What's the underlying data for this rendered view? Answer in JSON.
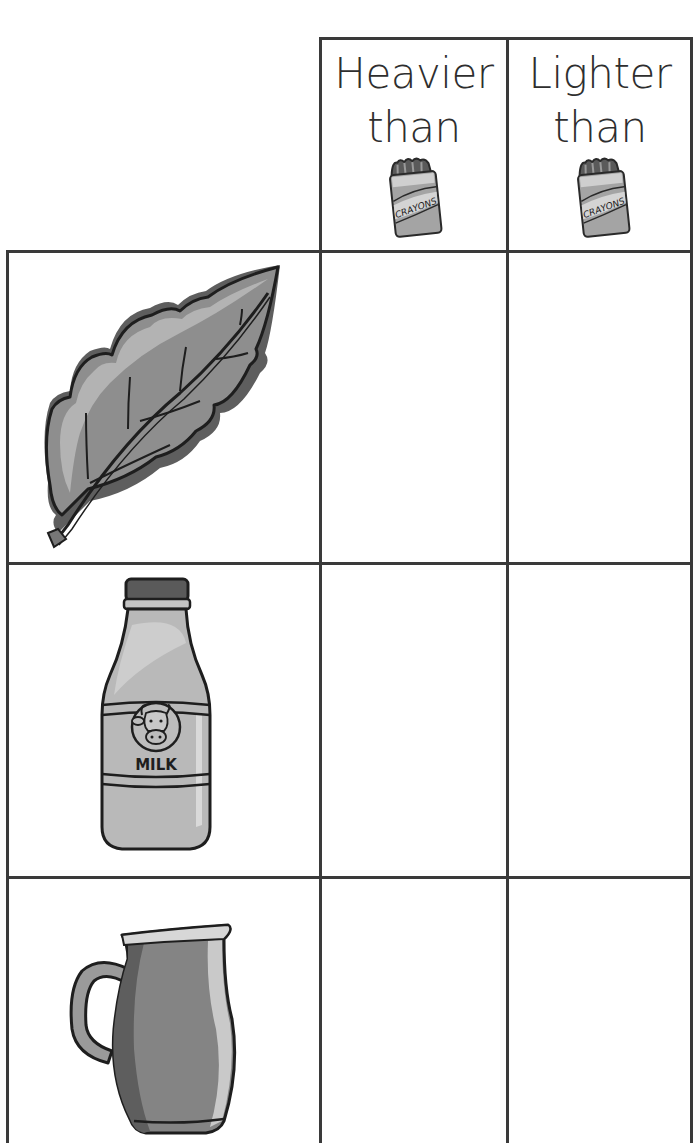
{
  "worksheet": {
    "columns": [
      {
        "id": "heavier",
        "line1": "Heavier",
        "line2": "than",
        "reference_icon": "crayon-box-icon",
        "reference_label": "CRAYONS"
      },
      {
        "id": "lighter",
        "line1": "Lighter",
        "line2": "than",
        "reference_icon": "crayon-box-icon",
        "reference_label": "CRAYONS"
      }
    ],
    "rows": [
      {
        "id": "leaf",
        "icon": "leaf-icon",
        "heavier_answer": "",
        "lighter_answer": ""
      },
      {
        "id": "milk-bottle",
        "icon": "milk-bottle-icon",
        "label": "MILK",
        "heavier_answer": "",
        "lighter_answer": ""
      },
      {
        "id": "pitcher",
        "icon": "pitcher-icon",
        "heavier_answer": "",
        "lighter_answer": ""
      }
    ]
  },
  "colors": {
    "grid_line": "#3a3a3a",
    "text": "#2e2e2e",
    "illustration_light": "#bdbdbd",
    "illustration_mid": "#8f8f8f",
    "illustration_dark": "#5c5c5c"
  }
}
